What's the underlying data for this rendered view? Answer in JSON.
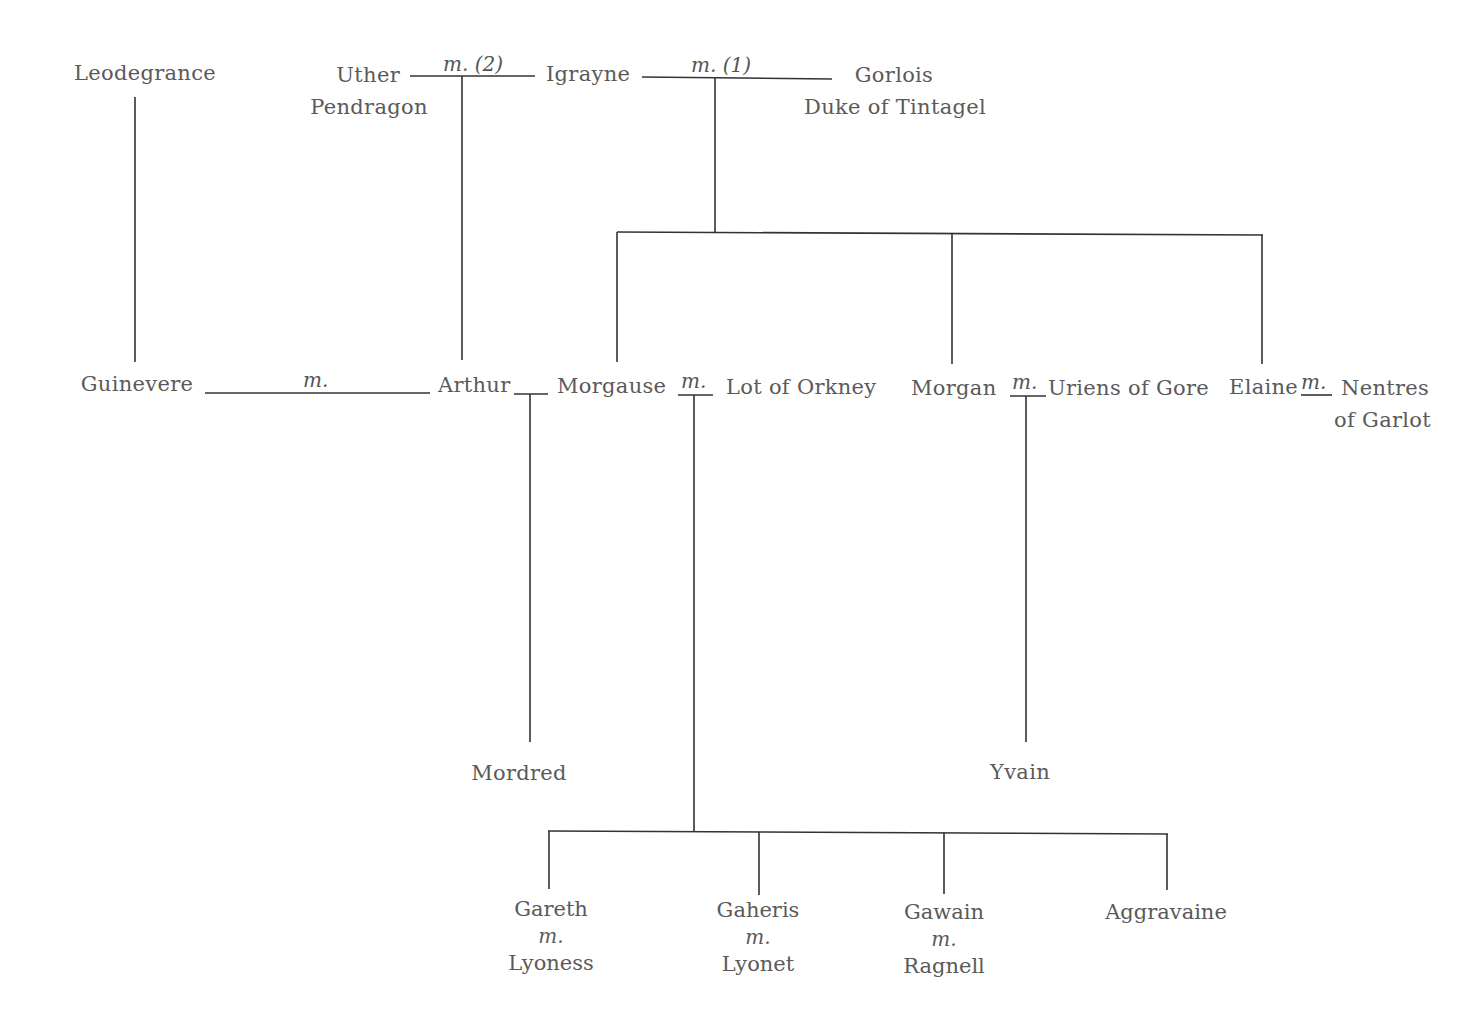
{
  "diagram": {
    "type": "family-tree",
    "title": "",
    "persons": {
      "leodegrance": "Leodegrance",
      "uther_1": "Uther",
      "uther_2": "Pendragon",
      "igrayne": "Igrayne",
      "gorlois_1": "Gorlois",
      "gorlois_2": "Duke of Tintagel",
      "guinevere": "Guinevere",
      "arthur": "Arthur",
      "morgause": "Morgause",
      "lot": "Lot of Orkney",
      "morgan": "Morgan",
      "uriens": "Uriens of Gore",
      "elaine": "Elaine",
      "nentres_1": "Nentres",
      "nentres_2": "of Garlot",
      "mordred": "Mordred",
      "yvain": "Yvain",
      "gareth": "Gareth",
      "lyoness": "Lyoness",
      "gaheris": "Gaheris",
      "lyonet": "Lyonet",
      "gawain": "Gawain",
      "ragnell": "Ragnell",
      "aggravaine": "Aggravaine"
    },
    "marriage_labels": {
      "uther_igrayne": "m. (2)",
      "igrayne_gorlois": "m. (1)",
      "guinevere_arthur": "m.",
      "morgause_lot": "m.",
      "morgan_uriens": "m.",
      "elaine_nentres": "m.",
      "gareth_lyoness": "m.",
      "gaheris_lyonet": "m.",
      "gawain_ragnell": "m."
    },
    "relationships": [
      {
        "parents": [
          "Leodegrance"
        ],
        "children": [
          "Guinevere"
        ]
      },
      {
        "parents": [
          "Uther Pendragon",
          "Igrayne"
        ],
        "children": [
          "Arthur"
        ]
      },
      {
        "parents": [
          "Igrayne",
          "Gorlois Duke of Tintagel"
        ],
        "children": [
          "Morgause",
          "Morgan",
          "Elaine"
        ]
      },
      {
        "parents": [
          "Arthur",
          "Morgause"
        ],
        "children": [
          "Mordred"
        ]
      },
      {
        "parents": [
          "Morgause",
          "Lot of Orkney"
        ],
        "children": [
          "Gareth",
          "Gaheris",
          "Gawain",
          "Aggravaine"
        ]
      },
      {
        "parents": [
          "Morgan",
          "Uriens of Gore"
        ],
        "children": [
          "Yvain"
        ]
      }
    ],
    "colors": {
      "text": "#5a5a5a",
      "lines": "#333333",
      "background": "#ffffff"
    }
  }
}
